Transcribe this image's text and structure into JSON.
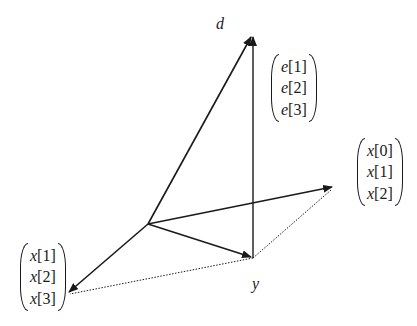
{
  "diagram": {
    "type": "vector-geometry",
    "colors": {
      "stroke": "#1a1a1a",
      "background": "#ffffff"
    },
    "points": {
      "origin": [
        148,
        224
      ],
      "d_tip": [
        252,
        35
      ],
      "y_point": [
        253,
        258
      ],
      "x_tip": [
        334,
        187
      ],
      "left_tip": [
        67,
        294
      ]
    },
    "labels": {
      "d": "d",
      "y": "y"
    },
    "vectors": {
      "e": {
        "var": "e",
        "entries": [
          "[1]",
          "[2]",
          "[3]"
        ]
      },
      "x_right": {
        "var": "x",
        "entries": [
          "[0]",
          "[1]",
          "[2]"
        ]
      },
      "x_left": {
        "var": "x",
        "entries": [
          "[1]",
          "[2]",
          "[3]"
        ]
      }
    }
  }
}
